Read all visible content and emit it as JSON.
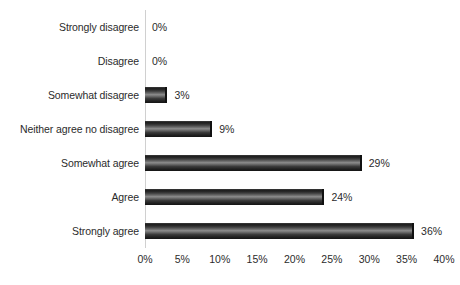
{
  "chart_data": {
    "type": "bar",
    "orientation": "horizontal",
    "title": "",
    "subtitle": "",
    "xlabel": "",
    "ylabel": "",
    "xlim": [
      0,
      40
    ],
    "grid": false,
    "legend": false,
    "legend_position": "none",
    "xtick_labels": [
      "0%",
      "5%",
      "10%",
      "15%",
      "20%",
      "25%",
      "30%",
      "35%",
      "40%"
    ],
    "xtick_values": [
      0,
      5,
      10,
      15,
      20,
      25,
      30,
      35,
      40
    ],
    "categories": [
      "Strongly disagree",
      "Disagree",
      "Somewhat disagree",
      "Neither agree no disagree",
      "Somewhat agree",
      "Agree",
      "Strongly agree"
    ],
    "values": [
      0,
      0,
      3,
      9,
      29,
      24,
      36
    ],
    "data_labels": [
      "0%",
      "0%",
      "3%",
      "9%",
      "29%",
      "24%",
      "36%"
    ],
    "series": [
      {
        "name": "Responses",
        "values": [
          0,
          0,
          3,
          9,
          29,
          24,
          36
        ]
      }
    ],
    "colors": {
      "bar_dark": "#1c1c1c",
      "bar_highlight": "#8c8c8c",
      "bar_edge": "#111111",
      "axis_line": "#d0d0d0",
      "text": "#2b2b2b",
      "background": "#ffffff"
    }
  }
}
